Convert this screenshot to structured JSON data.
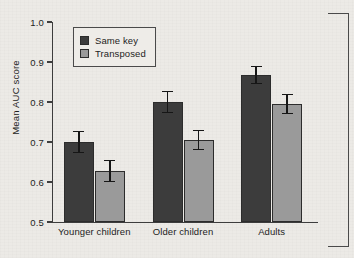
{
  "chart_data": {
    "type": "bar",
    "title": "",
    "xlabel": "",
    "ylabel": "Mean AUC score",
    "categories": [
      "Younger children",
      "Older children",
      "Adults"
    ],
    "ylim": [
      0.5,
      1.0
    ],
    "yticks": [
      "1.0",
      "0.9",
      "0.8",
      "0.7",
      "0.6",
      "0.5"
    ],
    "ytick_values": [
      1.0,
      0.9,
      0.8,
      0.7,
      0.6,
      0.5
    ],
    "grid": false,
    "legend_position": "top-left",
    "series": [
      {
        "name": "Same key",
        "color": "#3c3c3c",
        "values": [
          0.7,
          0.8,
          0.867
        ],
        "errors": [
          0.028,
          0.028,
          0.023
        ]
      },
      {
        "name": "Transposed",
        "color": "#9a9a9a",
        "values": [
          0.628,
          0.705,
          0.795
        ],
        "errors": [
          0.028,
          0.026,
          0.025
        ]
      }
    ]
  },
  "figure": {
    "background_color": "#eceae6",
    "axis_color": "#3d3d3d",
    "crop_bracket": "right-edge-crop-mark"
  }
}
